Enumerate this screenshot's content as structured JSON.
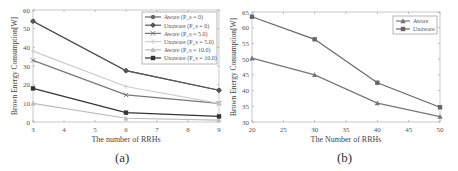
{
  "chart_data": [
    {
      "type": "line",
      "panel_label": "(a)",
      "xlabel": "The number of RRHs",
      "ylabel": "Brown Energy Consumption[W]",
      "x": [
        3,
        6,
        9
      ],
      "xticks": [
        3,
        4,
        5,
        6,
        7,
        8,
        9
      ],
      "yticks": [
        0,
        10,
        20,
        30,
        40,
        50,
        60
      ],
      "xlim": [
        3,
        9
      ],
      "ylim": [
        0,
        60
      ],
      "grid": false,
      "legend_position": "upper right",
      "series": [
        {
          "name": "Aware (P_s = 0)",
          "values": [
            54,
            27.5,
            17
          ],
          "color": "#666666",
          "marker": "circle"
        },
        {
          "name": "Unaware (P_s = 0)",
          "values": [
            54,
            27.5,
            17
          ],
          "color": "#555555",
          "marker": "diamond"
        },
        {
          "name": "Aware (P_s = 5.0)",
          "values": [
            33,
            14.5,
            10
          ],
          "color": "#777777",
          "marker": "x"
        },
        {
          "name": "Unaware (P_s = 5.0)",
          "values": [
            38,
            19,
            10
          ],
          "color": "#cccccc",
          "marker": "plus"
        },
        {
          "name": "Aware (P_s = 10.0)",
          "values": [
            10,
            2,
            1
          ],
          "color": "#bbbbbb",
          "marker": "triangle"
        },
        {
          "name": "Unaware (P_s = 10.0)",
          "values": [
            18,
            5,
            3
          ],
          "color": "#333333",
          "marker": "square"
        }
      ]
    },
    {
      "type": "line",
      "panel_label": "(b)",
      "xlabel": "The Number of RRHs",
      "ylabel": "Brown Energy Consumption[W]",
      "x": [
        20,
        30,
        40,
        50
      ],
      "xticks": [
        20,
        25,
        30,
        35,
        40,
        45,
        50
      ],
      "yticks": [
        30,
        35,
        40,
        45,
        50,
        55,
        60,
        65
      ],
      "xlim": [
        20,
        50
      ],
      "ylim": [
        30,
        65
      ],
      "grid": false,
      "legend_position": "upper right",
      "series": [
        {
          "name": "Aware",
          "values": [
            50.3,
            45,
            36,
            31.7
          ],
          "color": "#777777",
          "marker": "triangle"
        },
        {
          "name": "Unaware",
          "values": [
            63.5,
            56.3,
            42.5,
            34.7
          ],
          "color": "#666666",
          "marker": "square"
        }
      ]
    }
  ]
}
